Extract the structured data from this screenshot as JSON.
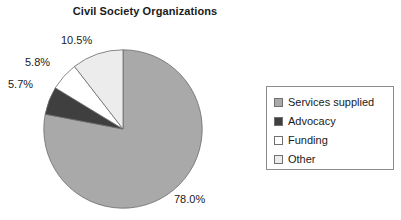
{
  "chart_data": {
    "type": "pie",
    "title": "Civil Society Organizations",
    "xlabel": "",
    "ylabel": "",
    "grid": false,
    "legend_position": "right",
    "start_angle_deg": 0,
    "direction": "clockwise",
    "categories": [
      "Services supplied",
      "Advocacy",
      "Funding",
      "Other"
    ],
    "values": [
      78.0,
      5.7,
      5.8,
      10.5
    ],
    "value_labels": [
      "78.0%",
      "5.7%",
      "5.8%",
      "10.5%"
    ],
    "colors": [
      "#a9a9a9",
      "#3f3f3f",
      "#ffffff",
      "#ececec"
    ],
    "slices": [
      {
        "label": "Services supplied",
        "value": 78.0,
        "value_label": "78.0%",
        "color": "#a9a9a9"
      },
      {
        "label": "Advocacy",
        "value": 5.7,
        "value_label": "5.7%",
        "color": "#3f3f3f"
      },
      {
        "label": "Funding",
        "value": 5.8,
        "value_label": "5.8%",
        "color": "#ffffff"
      },
      {
        "label": "Other",
        "value": 10.5,
        "value_label": "10.5%",
        "color": "#ececec"
      }
    ]
  },
  "title": {
    "text": "Civil Society Organizations"
  },
  "labels": {
    "other": "10.5%",
    "funding": "5.8%",
    "advocacy": "5.7%",
    "services": "78.0%"
  },
  "legend": {
    "items": [
      {
        "label": "Services supplied",
        "color": "#a9a9a9"
      },
      {
        "label": "Advocacy",
        "color": "#3f3f3f"
      },
      {
        "label": "Funding",
        "color": "#ffffff"
      },
      {
        "label": "Other",
        "color": "#ececec"
      }
    ]
  }
}
